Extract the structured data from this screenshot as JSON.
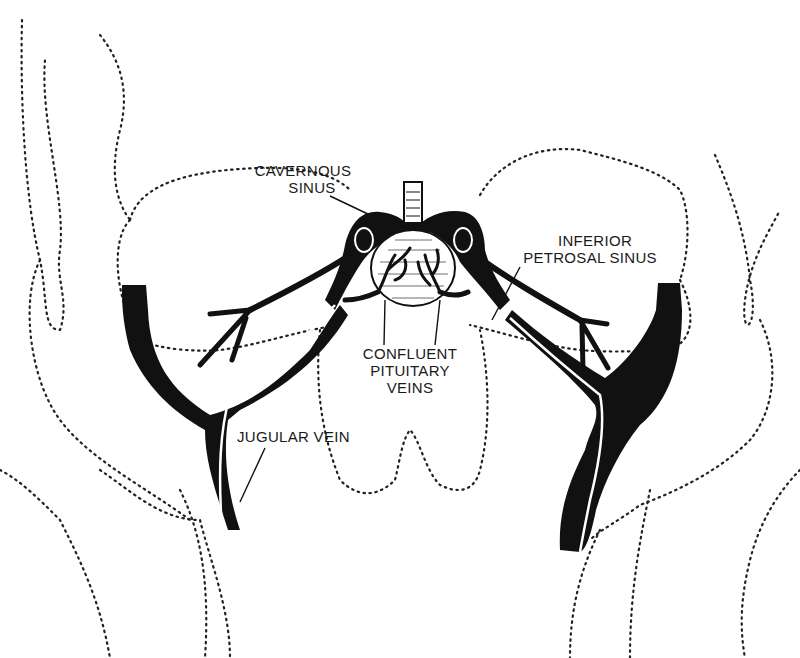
{
  "diagram": {
    "type": "anatomical-illustration",
    "colors": {
      "ink": "#111111",
      "background": "#ffffff"
    },
    "labels": {
      "cavernous_sinus": {
        "line1": "CAVERNOUS",
        "line2": "SINUS"
      },
      "inferior_petrosal_sinus": {
        "line1": "INFERIOR",
        "line2": "PETROSAL SINUS"
      },
      "confluent_pituitary_veins": {
        "line1": "CONFLUENT",
        "line2": "PITUITARY",
        "line3": "VEINS"
      },
      "jugular_vein": {
        "line1": "JUGULAR VEIN"
      }
    }
  }
}
